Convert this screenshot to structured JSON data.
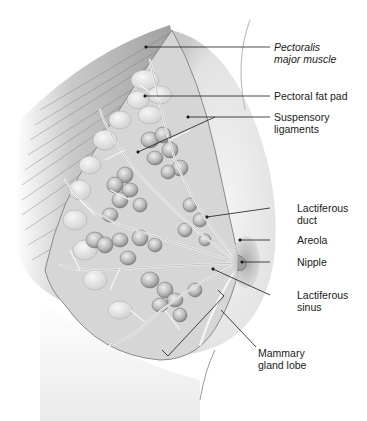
{
  "figure": {
    "colors": {
      "background": "#ffffff",
      "ink": "#1a1a1a",
      "tissue_light": "#e8e8e8",
      "tissue_mid": "#bdbdbd",
      "tissue_dark": "#8a8a8a"
    }
  },
  "labels": [
    {
      "id": "pectoralis",
      "line1": "Pectoralis",
      "line2": "major muscle",
      "italic": true
    },
    {
      "id": "fat_pad",
      "line1": "Pectoral fat pad"
    },
    {
      "id": "suspensory",
      "line1": "Suspensory",
      "line2": "ligaments"
    },
    {
      "id": "lactiferous_duct",
      "line1": "Lactiferous",
      "line2": "duct"
    },
    {
      "id": "areola",
      "line1": "Areola"
    },
    {
      "id": "nipple",
      "line1": "Nipple"
    },
    {
      "id": "lactiferous_sinus",
      "line1": "Lactiferous",
      "line2": "sinus"
    },
    {
      "id": "mammary_lobe",
      "line1": "Mammary",
      "line2": "gland lobe"
    }
  ]
}
